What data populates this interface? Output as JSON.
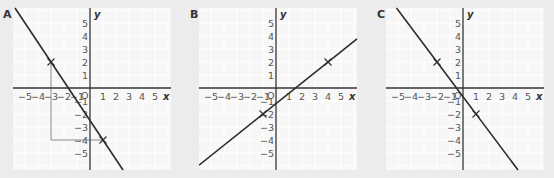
{
  "graphs": [
    {
      "label": "A",
      "x_axis_label": "x",
      "y_axis_label": "y",
      "origin_label": "O",
      "x_ticks": [
        "−5",
        "−4",
        "−3",
        "−2",
        "−1",
        "1",
        "2",
        "3",
        "4",
        "5"
      ],
      "y_ticks": [
        "5",
        "4",
        "3",
        "2",
        "1",
        "−1",
        "−2",
        "−3",
        "−4",
        "−5"
      ],
      "marked_points": [
        {
          "x": -3,
          "y": 2
        },
        {
          "x": 1,
          "y": -4
        }
      ],
      "line": {
        "slope": -1.5,
        "intercept": -2.5
      },
      "guide_lines": true
    },
    {
      "label": "B",
      "x_axis_label": "x",
      "y_axis_label": "y",
      "origin_label": "O",
      "x_ticks": [
        "−5",
        "−4",
        "−3",
        "−2",
        "−1",
        "1",
        "2",
        "3",
        "4",
        "5"
      ],
      "y_ticks": [
        "5",
        "4",
        "3",
        "2",
        "1",
        "−1",
        "−2",
        "−3",
        "−4",
        "−5"
      ],
      "marked_points": [
        {
          "x": -1,
          "y": -2
        },
        {
          "x": 4,
          "y": 2
        }
      ],
      "line": {
        "slope": 0.8,
        "intercept": -1.2
      },
      "guide_lines": false
    },
    {
      "label": "C",
      "x_axis_label": "x",
      "y_axis_label": "y",
      "origin_label": "O",
      "x_ticks": [
        "−5",
        "−4",
        "−3",
        "−2",
        "−1",
        "1",
        "2",
        "3",
        "4",
        "5"
      ],
      "y_ticks": [
        "5",
        "4",
        "3",
        "2",
        "1",
        "−1",
        "−2",
        "−3",
        "−4",
        "−5"
      ],
      "marked_points": [
        {
          "x": -2,
          "y": 2
        },
        {
          "x": 1,
          "y": -2
        }
      ],
      "line": {
        "slope": -1.3333,
        "intercept": -0.6667
      },
      "guide_lines": false
    }
  ],
  "colors": {
    "background": "#ececec",
    "panel": "#f7f7f7",
    "grid": "#ffffff",
    "axis": "#333333",
    "line": "#2b2b2b",
    "guide": "#888888",
    "text": "#555555"
  }
}
